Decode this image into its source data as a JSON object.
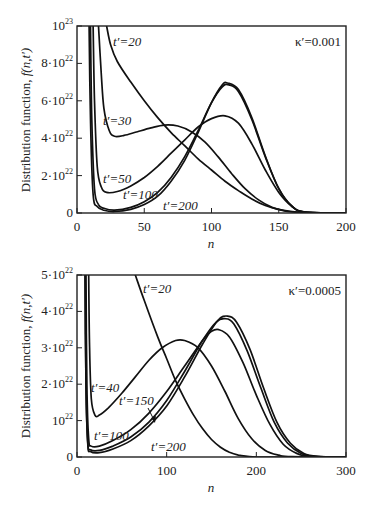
{
  "chart_data": [
    {
      "type": "line",
      "title": "",
      "annotation": "κ′=0.001",
      "xlabel": "n",
      "ylabel": "Distribution function, f(n,t′)",
      "xlim": [
        0,
        200
      ],
      "ylim": [
        0,
        1e+23
      ],
      "xticks": [
        0,
        50,
        100,
        150,
        200
      ],
      "yticks": [
        {
          "value": 0,
          "base": "0",
          "exp": ""
        },
        {
          "value": 2e+22,
          "base": "2·10",
          "exp": "22"
        },
        {
          "value": 4e+22,
          "base": "4·10",
          "exp": "22"
        },
        {
          "value": 6e+22,
          "base": "6·10",
          "exp": "22"
        },
        {
          "value": 8e+22,
          "base": "8·10",
          "exp": "22"
        },
        {
          "value": 1e+23,
          "base": "10",
          "exp": "23"
        }
      ],
      "grid": false,
      "legend": "inline labels",
      "series": [
        {
          "name": "t′=20",
          "x": [
            22,
            25,
            30,
            40,
            50,
            60,
            70,
            80,
            90,
            100,
            110,
            120,
            130,
            140,
            150,
            160,
            170,
            180,
            200
          ],
          "values": [
            1e+23,
            9e+22,
            8.1e+22,
            7e+22,
            6e+22,
            5.1e+22,
            4.3e+22,
            3.6e+22,
            2.9e+22,
            2.3e+22,
            1.7e+22,
            1.2e+22,
            7.5e+21,
            4e+21,
            2e+21,
            8e+20,
            3e+20,
            1e+20,
            0
          ]
        },
        {
          "name": "t′=30",
          "x": [
            16,
            18,
            20,
            24,
            28,
            35,
            45,
            55,
            65,
            75,
            85,
            95,
            105,
            115,
            125,
            135,
            145,
            155,
            165,
            175,
            200
          ],
          "values": [
            1e+23,
            7.5e+22,
            5.6e+22,
            4.4e+22,
            4.1e+22,
            4.15e+22,
            4.35e+22,
            4.55e+22,
            4.7e+22,
            4.65e+22,
            4.35e+22,
            3.8e+22,
            3e+22,
            2.1e+22,
            1.3e+22,
            7e+21,
            3e+21,
            1e+21,
            3e+20,
            0,
            0
          ]
        },
        {
          "name": "t′=50",
          "x": [
            12,
            13,
            15,
            18,
            22,
            30,
            40,
            50,
            60,
            70,
            80,
            90,
            100,
            110,
            120,
            130,
            140,
            150,
            160,
            170,
            200
          ],
          "values": [
            1e+23,
            6e+22,
            2.5e+22,
            1.4e+22,
            1.1e+22,
            1.15e+22,
            1.45e+22,
            1.9e+22,
            2.5e+22,
            3.2e+22,
            3.9e+22,
            4.6e+22,
            5.05e+22,
            5.2e+22,
            4.8e+22,
            3.7e+22,
            2.3e+22,
            1.1e+22,
            3.5e+21,
            5e+20,
            0
          ]
        },
        {
          "name": "t′=100",
          "x": [
            10,
            11,
            13,
            16,
            20,
            28,
            40,
            50,
            60,
            70,
            80,
            90,
            100,
            108,
            113,
            120,
            130,
            140,
            150,
            160,
            170,
            200
          ],
          "values": [
            1e+23,
            5e+22,
            1.3e+22,
            4.5e+21,
            2.5e+21,
            1.5e+21,
            3e+21,
            6e+21,
            1.1e+22,
            1.9e+22,
            3e+22,
            4.4e+22,
            5.9e+22,
            6.75e+22,
            6.85e+22,
            6.5e+22,
            5e+22,
            3e+22,
            1.3e+22,
            3.5e+21,
            5e+20,
            0
          ]
        },
        {
          "name": "t′=200",
          "x": [
            9,
            10,
            12,
            15,
            20,
            28,
            40,
            50,
            60,
            70,
            80,
            90,
            100,
            108,
            112,
            120,
            130,
            140,
            150,
            160,
            170,
            200
          ],
          "values": [
            1e+23,
            5e+22,
            1e+22,
            3.5e+21,
            1.5e+21,
            8e+20,
            2e+21,
            4.5e+21,
            9e+21,
            1.7e+22,
            2.8e+22,
            4.3e+22,
            5.9e+22,
            6.85e+22,
            6.95e+22,
            6.6e+22,
            5.1e+22,
            3.05e+22,
            1.3e+22,
            3.5e+21,
            5e+20,
            0
          ]
        }
      ]
    },
    {
      "type": "line",
      "title": "",
      "annotation": "κ′=0.0005",
      "xlabel": "n",
      "ylabel": "Distribution function, f(n,t′)",
      "xlim": [
        0,
        300
      ],
      "ylim": [
        0,
        5e+22
      ],
      "xticks": [
        0,
        100,
        200,
        300
      ],
      "yticks": [
        {
          "value": 0,
          "base": "0",
          "exp": ""
        },
        {
          "value": 1e+22,
          "base": "10",
          "exp": "22"
        },
        {
          "value": 2e+22,
          "base": "2·10",
          "exp": "22"
        },
        {
          "value": 3e+22,
          "base": "3·10",
          "exp": "22"
        },
        {
          "value": 4e+22,
          "base": "4·10",
          "exp": "22"
        },
        {
          "value": 5e+22,
          "base": "5·10",
          "exp": "22"
        }
      ],
      "grid": false,
      "legend": "inline labels",
      "series": [
        {
          "name": "t′=20",
          "x": [
            65,
            75,
            90,
            100,
            110,
            120,
            130,
            140,
            150,
            160,
            170,
            180,
            190,
            200,
            220,
            300
          ],
          "values": [
            5e+22,
            4.3e+22,
            3.3e+22,
            2.7e+22,
            2.1e+22,
            1.6e+22,
            1.15e+22,
            7.8e+21,
            4.8e+21,
            2.7e+21,
            1.3e+21,
            5e+20,
            2e+20,
            0,
            0,
            0
          ]
        },
        {
          "name": "t′=40",
          "x": [
            13,
            14,
            16,
            20,
            25,
            35,
            50,
            65,
            80,
            95,
            110,
            120,
            135,
            150,
            165,
            180,
            195,
            210,
            225,
            240,
            300
          ],
          "values": [
            5e+22,
            3e+22,
            1.6e+22,
            1.15e+22,
            1.15e+22,
            1.35e+22,
            1.75e+22,
            2.2e+22,
            2.65e+22,
            3e+22,
            3.2e+22,
            3.2e+22,
            3e+22,
            2.5e+22,
            1.8e+22,
            1.05e+22,
            5e+21,
            1.8e+21,
            5e+20,
            1e+20,
            0
          ]
        },
        {
          "name": "t′=100",
          "x": [
            10,
            11,
            13,
            16,
            25,
            40,
            60,
            80,
            100,
            120,
            140,
            150,
            158,
            170,
            185,
            200,
            215,
            230,
            245,
            260,
            300
          ],
          "values": [
            5e+22,
            2e+22,
            5e+21,
            3e+21,
            3e+21,
            4.5e+21,
            7.5e+21,
            1.2e+22,
            1.8e+22,
            2.5e+22,
            3.2e+22,
            3.45e+22,
            3.5e+22,
            3.3e+22,
            2.6e+22,
            1.7e+22,
            9e+21,
            3.5e+21,
            1e+21,
            2e+20,
            0
          ]
        },
        {
          "name": "t′=150",
          "x": [
            9,
            10,
            12,
            15,
            25,
            40,
            60,
            80,
            100,
            120,
            140,
            155,
            165,
            175,
            190,
            205,
            220,
            235,
            250,
            265,
            300
          ],
          "values": [
            5e+22,
            2e+22,
            4e+21,
            2e+21,
            1.8e+21,
            3e+21,
            5.5e+21,
            9.5e+21,
            1.55e+22,
            2.35e+22,
            3.2e+22,
            3.7e+22,
            3.8e+22,
            3.65e+22,
            2.9e+22,
            1.9e+22,
            9.5e+21,
            3.8e+21,
            1e+21,
            2e+20,
            0
          ]
        },
        {
          "name": "t′=200",
          "x": [
            9,
            10,
            12,
            15,
            25,
            40,
            60,
            80,
            100,
            120,
            140,
            157,
            168,
            178,
            193,
            208,
            223,
            238,
            253,
            268,
            300
          ],
          "values": [
            5e+22,
            2e+22,
            3.5e+21,
            1.5e+21,
            1.2e+21,
            2.2e+21,
            4.5e+21,
            8.5e+21,
            1.4e+22,
            2.2e+22,
            3.1e+22,
            3.75e+22,
            3.87e+22,
            3.7e+22,
            2.95e+22,
            1.9e+22,
            9.5e+21,
            3.8e+21,
            1e+21,
            2e+20,
            0
          ]
        }
      ]
    }
  ],
  "labels": {
    "top": {
      "annotation": "κ′=0.001",
      "xlabel": "n",
      "ylabel_text": "Distribution function, ",
      "ylabel_func": "f(n,t′)",
      "curve_labels": [
        {
          "text": "t′=20",
          "x": 113,
          "y": 46
        },
        {
          "text": "t′=30",
          "x": 103,
          "y": 125
        },
        {
          "text": "t′=50",
          "x": 103,
          "y": 183
        },
        {
          "text": "t′=100",
          "x": 123,
          "y": 199
        },
        {
          "text": "t′=200",
          "x": 163,
          "y": 210
        }
      ]
    },
    "bottom": {
      "annotation": "κ′=0.0005",
      "xlabel": "n",
      "ylabel_text": "Distribution function, ",
      "ylabel_func": "f(n,t′)",
      "curve_labels": [
        {
          "text": "t′=20",
          "x": 143,
          "y": 293
        },
        {
          "text": "t′=40",
          "x": 91,
          "y": 392
        },
        {
          "text": "t′=150",
          "x": 119,
          "y": 405
        },
        {
          "text": "t′=100",
          "x": 94,
          "y": 440
        },
        {
          "text": "t′=200",
          "x": 151,
          "y": 451
        }
      ]
    }
  }
}
